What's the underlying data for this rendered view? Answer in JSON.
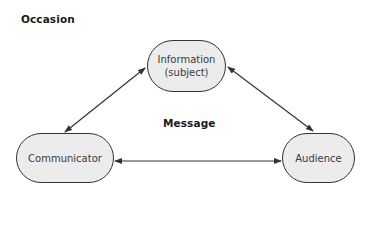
{
  "diagram": {
    "occasion_label": "Occasion",
    "message_label": "Message",
    "nodes": {
      "information": {
        "line1": "Information",
        "line2": "(subject)"
      },
      "communicator": {
        "label": "Communicator"
      },
      "audience": {
        "label": "Audience"
      }
    },
    "edges": [
      {
        "from": "information",
        "to": "communicator",
        "type": "bidirectional"
      },
      {
        "from": "information",
        "to": "audience",
        "type": "bidirectional"
      },
      {
        "from": "communicator",
        "to": "audience",
        "type": "bidirectional"
      }
    ],
    "colors": {
      "node_fill": "#ececec",
      "node_border": "#333333",
      "arrow": "#333333",
      "text": "#3a3a3a"
    }
  }
}
